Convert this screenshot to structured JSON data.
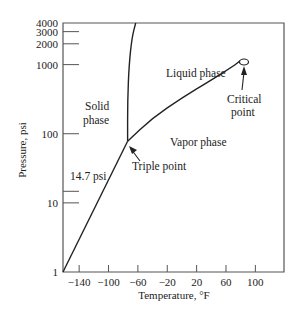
{
  "chart_data": {
    "type": "line",
    "title": "",
    "xlabel": "Temperature, °F",
    "ylabel": "Pressure, psi",
    "xlim": [
      -162,
      139
    ],
    "ylim": [
      1,
      4000
    ],
    "yscale": "log",
    "grid": false,
    "x_ticks": [
      -140,
      -100,
      -60,
      -20,
      20,
      60,
      100
    ],
    "x_tick_labels": [
      "−140",
      "−100",
      "−60",
      "−20",
      "20",
      "60",
      "100"
    ],
    "y_ticks": [
      1,
      10,
      14.7,
      100,
      1000,
      2000,
      3000,
      4000
    ],
    "y_tick_labels": [
      "1",
      "10",
      "",
      "100",
      "1000",
      "2000",
      "3000",
      "4000"
    ],
    "series": [
      {
        "name": "sublimation-curve",
        "x": [
          -162,
          -74
        ],
        "y": [
          1,
          78
        ]
      },
      {
        "name": "melting-curve",
        "x": [
          -74,
          -74,
          -72,
          -68,
          -63
        ],
        "y": [
          78,
          300,
          1000,
          2500,
          4000
        ]
      },
      {
        "name": "vaporization-curve",
        "x": [
          -74,
          -40,
          0,
          40,
          70,
          80
        ],
        "y": [
          78,
          170,
          330,
          600,
          950,
          1150
        ]
      }
    ],
    "annotations": [
      {
        "text": "Liquid phase",
        "x": -20,
        "y": 1000
      },
      {
        "text": "Solid phase",
        "x": -120,
        "y": 150
      },
      {
        "text": "Vapor phase",
        "x": 10,
        "y": 80
      },
      {
        "text": "14.7 psi",
        "x": -140,
        "y": 14.7
      },
      {
        "text": "Triple point",
        "x": -74,
        "y": 78
      },
      {
        "text": "Critical point",
        "x": 80,
        "y": 1200
      }
    ],
    "labels": {
      "liquid_line1": "Liquid phase",
      "solid_line1": "Solid",
      "solid_line2": "phase",
      "vapor": "Vapor phase",
      "atm": "14.7 psi",
      "triple": "Triple point",
      "critical_line1": "Critical",
      "critical_line2": "point"
    }
  }
}
